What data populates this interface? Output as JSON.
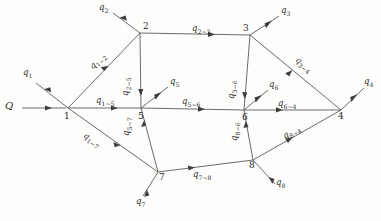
{
  "diagram": {
    "source": {
      "label": "Q"
    },
    "nodes": [
      {
        "id": "1",
        "label": "1",
        "x": 68,
        "y": 108
      },
      {
        "id": "2",
        "label": "2",
        "x": 140,
        "y": 33
      },
      {
        "id": "3",
        "label": "3",
        "x": 250,
        "y": 35
      },
      {
        "id": "4",
        "label": "4",
        "x": 341,
        "y": 110
      },
      {
        "id": "5",
        "label": "5",
        "x": 141,
        "y": 108
      },
      {
        "id": "6",
        "label": "6",
        "x": 244,
        "y": 110
      },
      {
        "id": "7",
        "label": "7",
        "x": 158,
        "y": 172
      },
      {
        "id": "8",
        "label": "8",
        "x": 253,
        "y": 160
      }
    ],
    "internal_flows": [
      {
        "name": "q1-2",
        "q": "q",
        "sub": "1~2",
        "from": "1",
        "to": "2"
      },
      {
        "name": "q1-5",
        "q": "q",
        "sub": "1~5",
        "from": "1",
        "to": "5"
      },
      {
        "name": "q1-7",
        "q": "q",
        "sub": "1~7",
        "from": "1",
        "to": "7"
      },
      {
        "name": "q2-3",
        "q": "q",
        "sub": "2~3",
        "from": "2",
        "to": "3"
      },
      {
        "name": "q2-5",
        "q": "q",
        "sub": "2~5",
        "from": "2",
        "to": "5"
      },
      {
        "name": "q5-6",
        "q": "q",
        "sub": "5~6",
        "from": "5",
        "to": "6"
      },
      {
        "name": "q5-7",
        "q": "q",
        "sub": "5~7",
        "from": "7",
        "to": "5"
      },
      {
        "name": "q3-4",
        "q": "q",
        "sub": "3~4",
        "from": "3",
        "to": "4"
      },
      {
        "name": "q3-6",
        "q": "q",
        "sub": "3~6",
        "from": "3",
        "to": "6"
      },
      {
        "name": "q6-4",
        "q": "q",
        "sub": "6~4",
        "from": "6",
        "to": "4"
      },
      {
        "name": "q7-8",
        "q": "q",
        "sub": "7~8",
        "from": "7",
        "to": "8"
      },
      {
        "name": "q8-6",
        "q": "q",
        "sub": "8~6",
        "from": "8",
        "to": "6"
      },
      {
        "name": "q8-4",
        "q": "q",
        "sub": "8~4",
        "from": "8",
        "to": "4"
      }
    ],
    "external_flows": [
      {
        "name": "q1",
        "q": "q",
        "sub": "1",
        "node": "1"
      },
      {
        "name": "q2",
        "q": "q",
        "sub": "2",
        "node": "2"
      },
      {
        "name": "q3",
        "q": "q",
        "sub": "3",
        "node": "3"
      },
      {
        "name": "q4",
        "q": "q",
        "sub": "4",
        "node": "4"
      },
      {
        "name": "q5",
        "q": "q",
        "sub": "5",
        "node": "5"
      },
      {
        "name": "q6",
        "q": "q",
        "sub": "6",
        "node": "6"
      },
      {
        "name": "q7",
        "q": "q",
        "sub": "7",
        "node": "7"
      },
      {
        "name": "q8",
        "q": "q",
        "sub": "8",
        "node": "8"
      }
    ]
  }
}
